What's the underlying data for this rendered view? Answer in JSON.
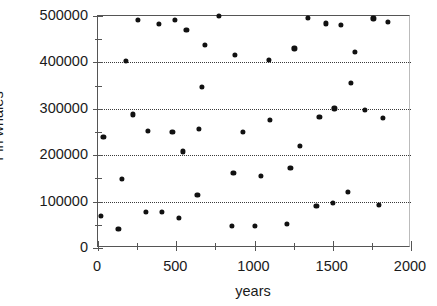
{
  "chart_data": {
    "type": "scatter",
    "title": "",
    "xlabel": "years",
    "ylabel": "Fin whales",
    "xlim": [
      0,
      2000
    ],
    "ylim": [
      0,
      500000
    ],
    "grid": true,
    "gridlines_y": [
      100000,
      200000,
      300000,
      400000
    ],
    "legend": "none",
    "x_ticks_major": [
      0,
      500,
      1000,
      1500,
      2000
    ],
    "x_ticks_minor": [
      250,
      750,
      1250,
      1750
    ],
    "x_ticklabels": [
      "0",
      "500",
      "1000",
      "1500",
      "2000"
    ],
    "y_ticks_major": [
      0,
      100000,
      200000,
      300000,
      400000,
      500000
    ],
    "y_ticklabels": [
      "0",
      "100000",
      "200000",
      "300000",
      "400000",
      "500000"
    ],
    "marker": "filled-circle",
    "marker_color": "#111111",
    "points": [
      [
        20,
        70000
      ],
      [
        35,
        240000
      ],
      [
        130,
        42000
      ],
      [
        155,
        149000
      ],
      [
        180,
        404000
      ],
      [
        225,
        288000
      ],
      [
        255,
        491000
      ],
      [
        305,
        77000
      ],
      [
        320,
        252000
      ],
      [
        390,
        483000
      ],
      [
        410,
        77000
      ],
      [
        475,
        250000
      ],
      [
        490,
        491000
      ],
      [
        515,
        64000
      ],
      [
        540,
        208000
      ],
      [
        565,
        470000
      ],
      [
        635,
        114000
      ],
      [
        645,
        256000
      ],
      [
        665,
        348000
      ],
      [
        685,
        437000
      ],
      [
        775,
        501000
      ],
      [
        855,
        48000
      ],
      [
        865,
        162000
      ],
      [
        875,
        417000
      ],
      [
        925,
        250000
      ],
      [
        1000,
        47000
      ],
      [
        1040,
        156000
      ],
      [
        1090,
        406000
      ],
      [
        1100,
        276000
      ],
      [
        1205,
        52000
      ],
      [
        1230,
        173000
      ],
      [
        1255,
        430000
      ],
      [
        1290,
        220000
      ],
      [
        1340,
        496000
      ],
      [
        1395,
        91000
      ],
      [
        1415,
        282000
      ],
      [
        1455,
        484000
      ],
      [
        1500,
        98000
      ],
      [
        1510,
        301000
      ],
      [
        1550,
        481000
      ],
      [
        1595,
        121000
      ],
      [
        1615,
        356000
      ],
      [
        1640,
        423000
      ],
      [
        1705,
        298000
      ],
      [
        1760,
        495000
      ],
      [
        1795,
        92000
      ],
      [
        1820,
        281000
      ],
      [
        1855,
        487000
      ]
    ]
  },
  "axes": {
    "y_title": "Fin whales",
    "x_title": "years"
  }
}
